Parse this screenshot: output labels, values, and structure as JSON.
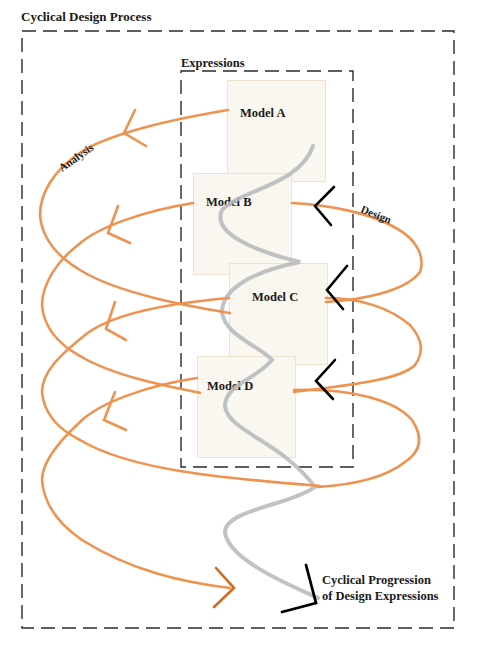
{
  "diagram": {
    "outer_frame": {
      "label": "Cyclical Design Process",
      "style": "dashed"
    },
    "inner_frame": {
      "label": "Expressions",
      "style": "dashed"
    },
    "models": [
      {
        "id": "a",
        "label": "Model A"
      },
      {
        "id": "b",
        "label": "Model B"
      },
      {
        "id": "c",
        "label": "Model C"
      },
      {
        "id": "d",
        "label": "Model D"
      }
    ],
    "cycle_labels": {
      "analysis": "Analysis",
      "design": "Design"
    },
    "caption": {
      "line1": "Cyclical Progression",
      "line2": "of Design Expressions"
    },
    "colors": {
      "cycle_curve": "#ee9250",
      "cycle_curve_dark": "#d4681f",
      "progression_helix": "#b8bcbe",
      "design_arrows": "#000000",
      "frame": "#2a2a2a",
      "model_fill": "#faf6f0",
      "model_border": "#f1e2d0"
    }
  }
}
